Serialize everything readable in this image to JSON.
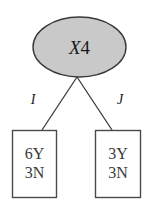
{
  "diagram": {
    "type": "decision-tree",
    "root": {
      "name": "root-node",
      "shape": "ellipse",
      "label_italic": "X",
      "label_plain": "4",
      "label_full": "X4",
      "fill_color": "#c9c9c9",
      "stroke_color": "#3a3a3a"
    },
    "edges": [
      {
        "name": "edge-left",
        "label": "I",
        "from": "root-node",
        "to": "leaf-left"
      },
      {
        "name": "edge-right",
        "label": "J",
        "from": "root-node",
        "to": "leaf-right"
      }
    ],
    "leaves": [
      {
        "name": "leaf-left",
        "shape": "rectangle",
        "fill_color": "#ffffff",
        "stroke_color": "#4a4a4a",
        "lines": [
          "6Y",
          "3N"
        ]
      },
      {
        "name": "leaf-right",
        "shape": "rectangle",
        "fill_color": "#ffffff",
        "stroke_color": "#4a4a4a",
        "lines": [
          "3Y",
          "3N"
        ]
      }
    ]
  }
}
